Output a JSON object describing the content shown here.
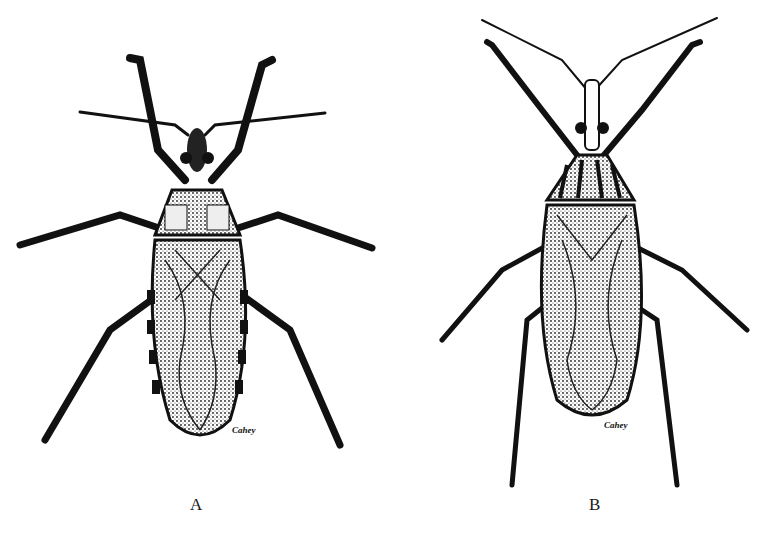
{
  "figure": {
    "panels": [
      {
        "id": "A",
        "label": "A",
        "signature": "Cahey",
        "subject": "insect-dorsal-view-broad"
      },
      {
        "id": "B",
        "label": "B",
        "signature": "Cahey",
        "subject": "insect-dorsal-view-slender"
      }
    ],
    "colors": {
      "ink": "#111111",
      "paper": "#ffffff",
      "stipple": "#555555"
    }
  }
}
